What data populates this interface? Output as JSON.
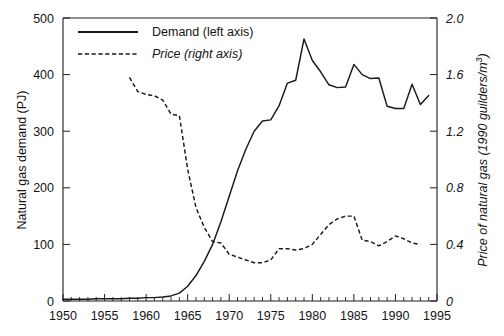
{
  "chart_data": {
    "type": "line",
    "title": "",
    "xlabel": "",
    "ylabel": "Natural gas demand (PJ)",
    "y2label": "Price of natural gas (1990 guilders/m³)",
    "xlim": [
      1950,
      1995
    ],
    "ylim": [
      0,
      500
    ],
    "y2lim": [
      0,
      2.0
    ],
    "grid": false,
    "legend_position": "top-left",
    "x_ticks": [
      1950,
      1955,
      1960,
      1965,
      1970,
      1975,
      1980,
      1985,
      1990,
      1995
    ],
    "x_tick_labels": [
      "1950",
      "1955",
      "1960",
      "1965",
      "1970",
      "1975",
      "1980",
      "1985",
      "1990",
      "1995"
    ],
    "x_minor_tick_step": 1,
    "y_ticks": [
      0,
      100,
      200,
      300,
      400,
      500
    ],
    "y_tick_labels": [
      "0",
      "100",
      "200",
      "300",
      "400",
      "500"
    ],
    "y2_ticks": [
      0,
      0.4,
      0.8,
      1.2,
      1.6,
      2.0
    ],
    "y2_tick_labels": [
      "0",
      "0.4",
      "0.8",
      "1.2",
      "1.6",
      "2.0"
    ],
    "legend": [
      {
        "label": "Demand (left axis)",
        "style": "solid",
        "italic": false,
        "axis": "left"
      },
      {
        "label": "Price (right axis)",
        "style": "dashed",
        "italic": true,
        "axis": "right"
      }
    ],
    "series": [
      {
        "name": "Demand (left axis)",
        "axis": "left",
        "style": "solid",
        "units": "PJ",
        "x": [
          1950,
          1951,
          1952,
          1953,
          1954,
          1955,
          1956,
          1957,
          1958,
          1959,
          1960,
          1961,
          1962,
          1963,
          1964,
          1965,
          1966,
          1967,
          1968,
          1969,
          1970,
          1971,
          1972,
          1973,
          1974,
          1975,
          1976,
          1977,
          1978,
          1979,
          1980,
          1981,
          1982,
          1983,
          1984,
          1985,
          1986,
          1987,
          1988,
          1989,
          1990,
          1991,
          1992,
          1993,
          1994
        ],
        "values": [
          3,
          3,
          3,
          3,
          4,
          4,
          4,
          4,
          5,
          5,
          6,
          6,
          7,
          9,
          14,
          26,
          45,
          70,
          100,
          140,
          185,
          230,
          268,
          300,
          318,
          320,
          345,
          385,
          390,
          463,
          425,
          405,
          382,
          377,
          378,
          418,
          400,
          393,
          394,
          344,
          340,
          340,
          383,
          347,
          363
        ]
      },
      {
        "name": "Price (right axis)",
        "axis": "right",
        "style": "dashed",
        "units": "1990 guilders/m³",
        "x": [
          1958,
          1959,
          1960,
          1961,
          1962,
          1963,
          1964,
          1965,
          1966,
          1967,
          1968,
          1969,
          1970,
          1971,
          1972,
          1973,
          1974,
          1975,
          1976,
          1977,
          1978,
          1979,
          1980,
          1981,
          1982,
          1983,
          1984,
          1985,
          1986,
          1987,
          1988,
          1989,
          1990,
          1991,
          1992,
          1993
        ],
        "values": [
          1.58,
          1.48,
          1.46,
          1.45,
          1.42,
          1.32,
          1.31,
          0.93,
          0.66,
          0.52,
          0.42,
          0.41,
          0.33,
          0.31,
          0.29,
          0.27,
          0.27,
          0.29,
          0.37,
          0.37,
          0.36,
          0.37,
          0.4,
          0.47,
          0.54,
          0.58,
          0.6,
          0.6,
          0.43,
          0.42,
          0.39,
          0.42,
          0.46,
          0.44,
          0.41,
          0.4
        ]
      }
    ]
  },
  "figure": {
    "plot_left": 63,
    "plot_right": 437,
    "plot_top": 18,
    "plot_bottom": 301
  }
}
